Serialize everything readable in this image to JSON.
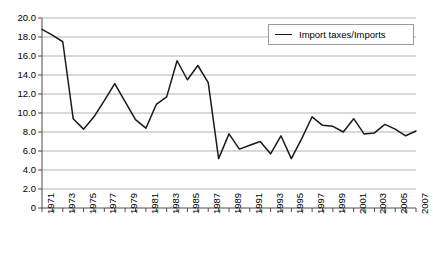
{
  "chart_data": {
    "type": "line",
    "title": "",
    "xlabel": "",
    "ylabel": "",
    "legend_position": "top-right",
    "grid": true,
    "xlim": [
      1971,
      2007
    ],
    "ylim": [
      0,
      20
    ],
    "ytick_labels": [
      "20.0",
      "18.0",
      "16.0",
      "14.0",
      "12.0",
      "10.0",
      "8.0",
      "6.0",
      "4.0",
      "2.0",
      "0"
    ],
    "ytick_values": [
      20,
      18,
      16,
      14,
      12,
      10,
      8,
      6,
      4,
      2,
      0
    ],
    "xtick_labels": [
      "1971",
      "1973",
      "1975",
      "1977",
      "1979",
      "1981",
      "1983",
      "1985",
      "1987",
      "1989",
      "1991",
      "1993",
      "1995",
      "1997",
      "1999",
      "2001",
      "2003",
      "2005",
      "2007"
    ],
    "x": [
      1971,
      1972,
      1973,
      1974,
      1975,
      1976,
      1977,
      1978,
      1979,
      1980,
      1981,
      1982,
      1983,
      1984,
      1985,
      1986,
      1987,
      1988,
      1989,
      1990,
      1991,
      1992,
      1993,
      1994,
      1995,
      1996,
      1997,
      1998,
      1999,
      2000,
      2001,
      2002,
      2003,
      2004,
      2005,
      2006,
      2007
    ],
    "series": [
      {
        "name": "Import taxes/Imports",
        "color": "#1a1a1a",
        "values": [
          18.8,
          18.2,
          17.5,
          9.4,
          8.3,
          9.6,
          11.3,
          13.1,
          11.2,
          9.3,
          8.4,
          10.9,
          11.7,
          15.5,
          13.5,
          15.0,
          13.2,
          5.2,
          7.8,
          6.2,
          6.6,
          7.0,
          5.7,
          7.6,
          5.2,
          7.3,
          9.6,
          8.7,
          8.6,
          8.0,
          9.4,
          7.8,
          7.9,
          8.8,
          8.3,
          7.6,
          8.1
        ]
      }
    ]
  },
  "legend": {
    "entries": [
      {
        "label": "Import taxes/Imports"
      }
    ]
  }
}
